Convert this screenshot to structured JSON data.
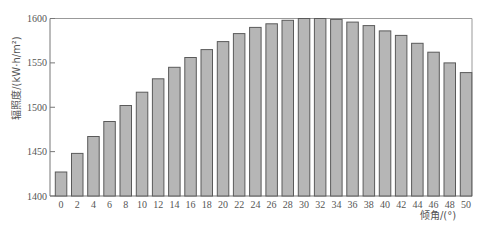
{
  "chart_data": {
    "type": "bar",
    "title": "",
    "xlabel": "倾角/(°)",
    "ylabel": "辐照度/(kW·h/m²)",
    "categories": [
      "0",
      "2",
      "4",
      "6",
      "8",
      "10",
      "12",
      "14",
      "16",
      "18",
      "20",
      "22",
      "24",
      "26",
      "28",
      "30",
      "32",
      "34",
      "36",
      "38",
      "40",
      "42",
      "44",
      "46",
      "48",
      "50"
    ],
    "values": [
      1427,
      1448,
      1467,
      1484,
      1502,
      1517,
      1532,
      1545,
      1556,
      1565,
      1574,
      1583,
      1590,
      1594,
      1598,
      1600,
      1600,
      1599,
      1596,
      1592,
      1586,
      1581,
      1572,
      1562,
      1550,
      1539
    ],
    "ylim": [
      1400,
      1600
    ],
    "yticks": [
      1400,
      1450,
      1500,
      1550,
      1600
    ],
    "grid": false,
    "legend": null,
    "colors": {
      "bar_fill": "#b6b6b6",
      "bar_stroke": "#5a5a5a",
      "axis": "#777777"
    }
  }
}
